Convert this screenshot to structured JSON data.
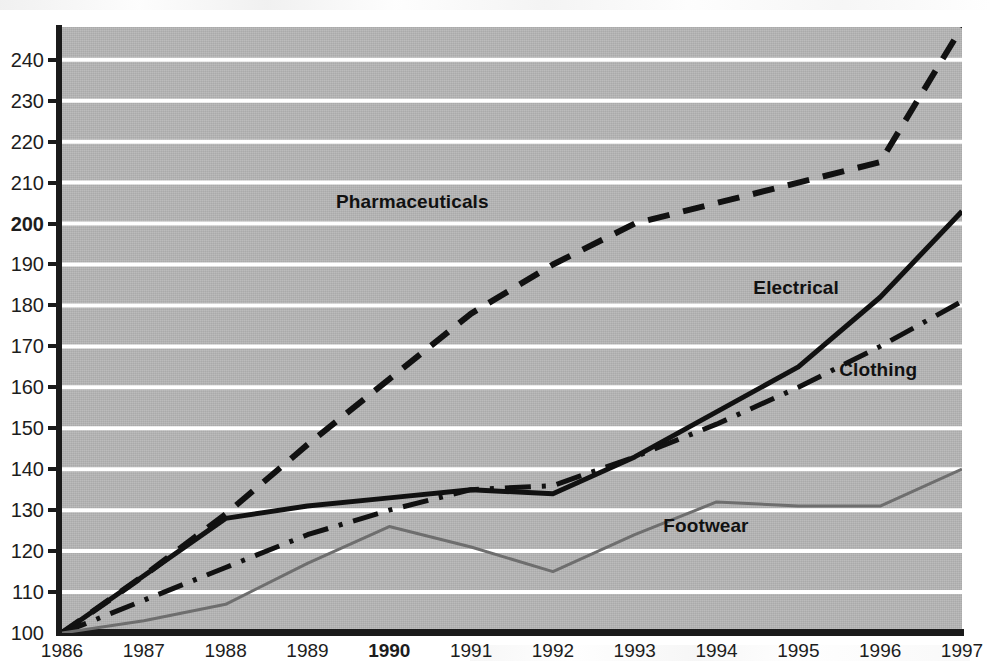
{
  "chart_data": {
    "type": "line",
    "title": "",
    "subtitle": "",
    "xlabel": "",
    "ylabel": "",
    "categories": [
      "1986",
      "1987",
      "1988",
      "1989",
      "1990",
      "1991",
      "1992",
      "1993",
      "1994",
      "1995",
      "1996",
      "1997"
    ],
    "x": [
      1986,
      1987,
      1988,
      1989,
      1990,
      1991,
      1992,
      1993,
      1994,
      1995,
      1996,
      1997
    ],
    "xlim": [
      1986,
      1997
    ],
    "ylim": [
      100,
      248
    ],
    "y_ticks": [
      100,
      110,
      120,
      130,
      140,
      150,
      160,
      170,
      180,
      190,
      200,
      210,
      220,
      230,
      240
    ],
    "y_tick_bold": [
      200
    ],
    "x_tick_bold": [
      "1990"
    ],
    "grid": true,
    "grid_orientation": "horizontal",
    "grid_color": "#ffffff",
    "plot_background": "#b5b5b5",
    "legend_position": "inline-labels",
    "index_base": "1986 = 100",
    "series": [
      {
        "name": "Pharmaceuticals",
        "style": "dashed",
        "color": "#111111",
        "width": 6,
        "values": [
          100,
          114,
          129,
          146,
          162,
          178,
          190,
          200,
          205,
          210,
          215,
          248
        ],
        "label_x": 1989.35,
        "label_y": 205
      },
      {
        "name": "Electrical",
        "style": "solid",
        "color": "#111111",
        "width": 5,
        "values": [
          100,
          114,
          128,
          131,
          133,
          135,
          134,
          143,
          154,
          165,
          182,
          203
        ],
        "label_x": 1994.45,
        "label_y": 184
      },
      {
        "name": "Clothing",
        "style": "dashdot",
        "color": "#111111",
        "width": 5,
        "values": [
          100,
          108,
          116,
          124,
          130,
          135,
          136,
          143,
          151,
          160,
          170,
          181
        ],
        "label_x": 1995.5,
        "label_y": 164
      },
      {
        "name": "Footwear",
        "style": "solid",
        "color": "#6e6e6e",
        "width": 3,
        "values": [
          100,
          103,
          107,
          117,
          126,
          121,
          115,
          124,
          132,
          131,
          131,
          140
        ],
        "label_x": 1993.35,
        "label_y": 126
      }
    ]
  },
  "y_axis": {
    "labels": [
      {
        "value": "240",
        "bold": false
      },
      {
        "value": "230",
        "bold": false
      },
      {
        "value": "220",
        "bold": false
      },
      {
        "value": "210",
        "bold": false
      },
      {
        "value": "200",
        "bold": true
      },
      {
        "value": "190",
        "bold": false
      },
      {
        "value": "180",
        "bold": false
      },
      {
        "value": "170",
        "bold": false
      },
      {
        "value": "160",
        "bold": false
      },
      {
        "value": "150",
        "bold": false
      },
      {
        "value": "140",
        "bold": false
      },
      {
        "value": "130",
        "bold": false
      },
      {
        "value": "120",
        "bold": false
      },
      {
        "value": "110",
        "bold": false
      },
      {
        "value": "100",
        "bold": false
      }
    ]
  },
  "x_axis": {
    "labels": [
      {
        "value": "1986",
        "bold": false
      },
      {
        "value": "1987",
        "bold": false
      },
      {
        "value": "1988",
        "bold": false
      },
      {
        "value": "1989",
        "bold": false
      },
      {
        "value": "1990",
        "bold": true
      },
      {
        "value": "1991",
        "bold": false
      },
      {
        "value": "1992",
        "bold": false
      },
      {
        "value": "1993",
        "bold": false
      },
      {
        "value": "1994",
        "bold": false
      },
      {
        "value": "1995",
        "bold": false
      },
      {
        "value": "1996",
        "bold": false
      },
      {
        "value": "1997",
        "bold": false
      }
    ]
  }
}
